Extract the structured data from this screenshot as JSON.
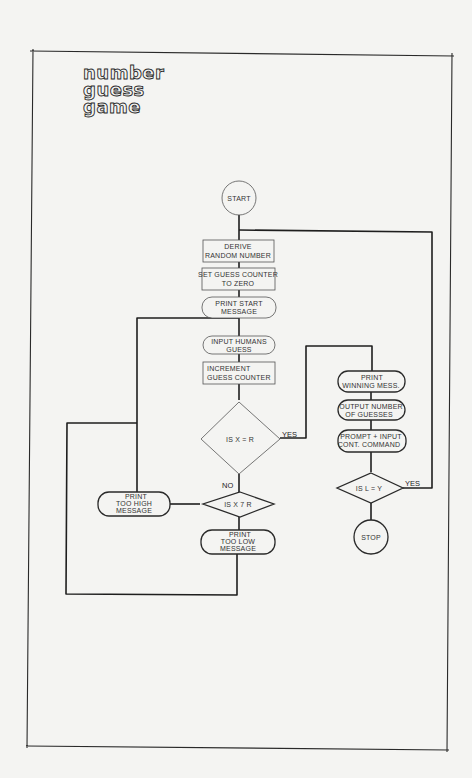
{
  "title": [
    "number",
    "guess",
    "game"
  ],
  "nodes": {
    "start": {
      "shape": "terminator-circle",
      "lines": [
        "START"
      ]
    },
    "derive": {
      "shape": "process",
      "lines": [
        "DERIVE",
        "RANDOM NUMBER"
      ]
    },
    "set_counter": {
      "shape": "process",
      "lines": [
        "SET GUESS COUNTER",
        "TO ZERO"
      ]
    },
    "print_start": {
      "shape": "io",
      "lines": [
        "PRINT START",
        "MESSAGE"
      ]
    },
    "input_guess": {
      "shape": "io",
      "lines": [
        "INPUT HUMANS",
        "GUESS"
      ]
    },
    "increment": {
      "shape": "process",
      "lines": [
        "INCREMENT",
        "GUESS COUNTER"
      ]
    },
    "decision_equal": {
      "shape": "decision",
      "lines": [
        "IS X = R"
      ]
    },
    "decision_greater": {
      "shape": "decision",
      "lines": [
        "IS X 7 R"
      ]
    },
    "too_high": {
      "shape": "io",
      "lines": [
        "PRINT",
        "TOO HIGH",
        "MESSAGE"
      ]
    },
    "too_low": {
      "shape": "io",
      "lines": [
        "PRINT",
        "TOO LOW",
        "MESSAGE"
      ]
    },
    "winning": {
      "shape": "io",
      "lines": [
        "PRINT",
        "WINNING MESS."
      ]
    },
    "output_count": {
      "shape": "io",
      "lines": [
        "OUTPUT NUMBER",
        "OF GUESSES"
      ]
    },
    "prompt": {
      "shape": "io",
      "lines": [
        "PROMPT + INPUT",
        "CONT. COMMAND"
      ]
    },
    "decision_continue": {
      "shape": "decision",
      "lines": [
        "IS L = Y"
      ]
    },
    "stop": {
      "shape": "terminator-circle",
      "lines": [
        "STOP"
      ]
    }
  },
  "edge_labels": {
    "equal_yes": "YES",
    "equal_no": "NO",
    "continue_yes": "YES"
  },
  "edges": [
    [
      "start",
      "derive"
    ],
    [
      "derive",
      "set_counter"
    ],
    [
      "set_counter",
      "print_start"
    ],
    [
      "print_start",
      "input_guess"
    ],
    [
      "input_guess",
      "increment"
    ],
    [
      "increment",
      "decision_equal"
    ],
    [
      "decision_equal",
      "winning",
      "YES"
    ],
    [
      "decision_equal",
      "decision_greater",
      "NO"
    ],
    [
      "decision_greater",
      "too_high",
      "left"
    ],
    [
      "decision_greater",
      "too_low",
      "down"
    ],
    [
      "too_high",
      "input_guess"
    ],
    [
      "too_low",
      "input_guess"
    ],
    [
      "winning",
      "output_count"
    ],
    [
      "output_count",
      "prompt"
    ],
    [
      "prompt",
      "decision_continue"
    ],
    [
      "decision_continue",
      "derive",
      "YES"
    ],
    [
      "decision_continue",
      "stop"
    ]
  ]
}
